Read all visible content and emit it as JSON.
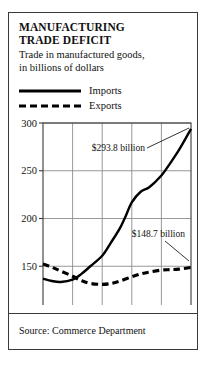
{
  "card": {
    "title_line1": "MANUFACTURING",
    "title_line2": "TRADE DEFICIT",
    "subtitle_line1": "Trade in manufactured goods,",
    "subtitle_line2": "in billions of dollars",
    "source": "Source: Commerce Department",
    "border_color": "#3a3a3a",
    "background": "#ffffff"
  },
  "legend": {
    "position": "top-left",
    "items": [
      {
        "label": "Imports",
        "style": "solid",
        "color": "#000000"
      },
      {
        "label": "Exports",
        "style": "dashed",
        "color": "#000000"
      }
    ]
  },
  "chart_data": {
    "type": "line",
    "title": "MANUFACTURING TRADE DEFICIT",
    "subtitle": "Trade in manufactured goods, in billions of dollars",
    "xlabel": "",
    "ylabel": "",
    "xlim": [
      1981,
      1986
    ],
    "ylim": [
      100,
      300
    ],
    "yticks": [
      100,
      150,
      200,
      250,
      300
    ],
    "ytick_labels": [
      "100",
      "150",
      "200",
      "250",
      "300"
    ],
    "xticks": [
      1981,
      1982,
      1983,
      1984,
      1985,
      1986
    ],
    "xtick_labels": [
      "'81",
      "'82",
      "'83",
      "'84",
      "'85",
      "'86"
    ],
    "grid": true,
    "grid_color": "#8c8c8c",
    "axis_color": "#3a3a3a",
    "legend_position": "above-plot",
    "series": [
      {
        "name": "Imports",
        "style": "solid",
        "color": "#000000",
        "x": [
          1981.0,
          1981.3,
          1981.6,
          1982.0,
          1982.3,
          1982.6,
          1983.0,
          1983.3,
          1983.6,
          1983.8,
          1984.0,
          1984.3,
          1984.6,
          1985.0,
          1985.3,
          1985.6,
          1986.0
        ],
        "values": [
          137.0,
          134.5,
          133.5,
          136.0,
          142.0,
          150.0,
          161.0,
          175.0,
          190.0,
          203.0,
          217.0,
          228.0,
          233.0,
          245.0,
          258.0,
          272.0,
          293.8
        ]
      },
      {
        "name": "Exports",
        "style": "dashed",
        "color": "#000000",
        "x": [
          1981.0,
          1981.3,
          1981.6,
          1982.0,
          1982.3,
          1982.6,
          1983.0,
          1983.3,
          1983.6,
          1984.0,
          1984.3,
          1984.6,
          1985.0,
          1985.3,
          1985.6,
          1986.0
        ],
        "values": [
          152.5,
          149.0,
          145.0,
          139.5,
          135.0,
          132.0,
          131.0,
          132.0,
          134.5,
          139.0,
          142.0,
          144.0,
          146.0,
          146.5,
          147.0,
          148.7
        ]
      }
    ],
    "annotations": [
      {
        "text": "$293.8 billion",
        "value": 293.8,
        "series": "Imports",
        "point": [
          1986.0,
          293.8
        ]
      },
      {
        "text": "$148.7 billion",
        "value": 148.7,
        "series": "Exports",
        "point": [
          1986.0,
          148.7
        ]
      }
    ]
  }
}
